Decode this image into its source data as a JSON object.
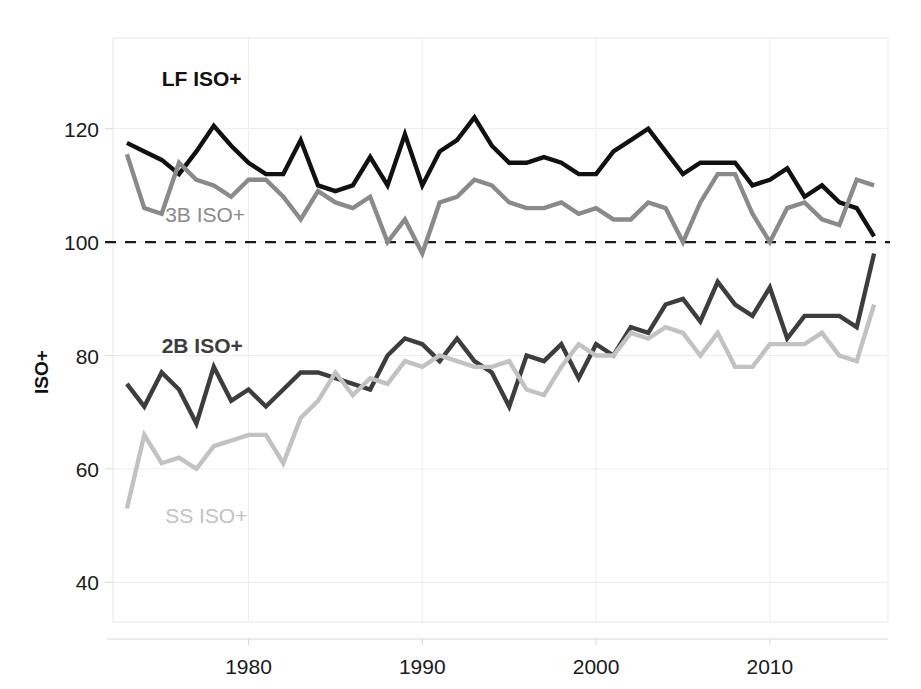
{
  "chart_data": {
    "type": "line",
    "title": "",
    "xlabel": "",
    "ylabel": "ISO+",
    "xlim": [
      1972.2,
      2016.8
    ],
    "ylim": [
      33,
      136
    ],
    "grid": true,
    "legend": "inline-annotations",
    "x_ticks": [
      1980,
      1990,
      2000,
      2010
    ],
    "y_ticks": [
      40,
      60,
      80,
      100,
      120
    ],
    "reference_line": {
      "value": 100,
      "style": "dashed",
      "color": "#1a1a1a"
    },
    "x": [
      1973,
      1974,
      1975,
      1976,
      1977,
      1978,
      1979,
      1980,
      1981,
      1982,
      1983,
      1984,
      1985,
      1986,
      1987,
      1988,
      1989,
      1990,
      1991,
      1992,
      1993,
      1994,
      1995,
      1996,
      1997,
      1998,
      1999,
      2000,
      2001,
      2002,
      2003,
      2004,
      2005,
      2006,
      2007,
      2008,
      2009,
      2010,
      2011,
      2012,
      2013,
      2014,
      2015,
      2016
    ],
    "series": [
      {
        "name": "LF ISO+",
        "color": "#111111",
        "width": 4.4,
        "label_x": 1975.0,
        "label_y": 127.5,
        "values": [
          117.5,
          116,
          114.5,
          112,
          116,
          120.5,
          117,
          114,
          112,
          112,
          118,
          110,
          109,
          110,
          115,
          110,
          119,
          110,
          116,
          118,
          122,
          117,
          114,
          114,
          115,
          114,
          112,
          112,
          116,
          118,
          120,
          116,
          112,
          114,
          114,
          114,
          110,
          111,
          113,
          108,
          110,
          107,
          106,
          101
        ]
      },
      {
        "name": "3B ISO+",
        "color": "#8a8a8a",
        "width": 4.4,
        "label_x": 1975.2,
        "label_y": 103.5,
        "values": [
          115.5,
          106,
          105,
          114,
          111,
          110,
          108,
          111,
          111,
          108,
          104,
          109,
          107,
          106,
          108,
          100,
          104,
          98,
          107,
          108,
          111,
          110,
          107,
          106,
          106,
          107,
          105,
          106,
          104,
          104,
          107,
          106,
          100,
          107,
          112,
          112,
          105,
          100,
          106,
          107,
          104,
          103,
          111,
          110
        ]
      },
      {
        "name": "2B ISO+",
        "color": "#3d3d3d",
        "width": 4.4,
        "label_x": 1975.0,
        "label_y": 80.5,
        "values": [
          75,
          71,
          77,
          74,
          68,
          78,
          72,
          74,
          71,
          74,
          77,
          77,
          76,
          75,
          74,
          80,
          83,
          82,
          79,
          83,
          79,
          77,
          71,
          80,
          79,
          82,
          76,
          82,
          80,
          85,
          84,
          89,
          90,
          86,
          93,
          89,
          87,
          92,
          83,
          87,
          87,
          87,
          85,
          98
        ]
      },
      {
        "name": "SS ISO+",
        "color": "#c2c2c2",
        "width": 4.4,
        "label_x": 1975.2,
        "label_y": 50.5,
        "values": [
          53,
          66,
          61,
          62,
          60,
          64,
          65,
          66,
          66,
          61,
          69,
          72,
          77,
          73,
          76,
          75,
          79,
          78,
          80,
          79,
          78,
          78,
          79,
          74,
          73,
          78,
          82,
          80,
          80,
          84,
          83,
          85,
          84,
          80,
          84,
          78,
          78,
          82,
          82,
          82,
          84,
          80,
          79,
          89
        ]
      }
    ]
  }
}
